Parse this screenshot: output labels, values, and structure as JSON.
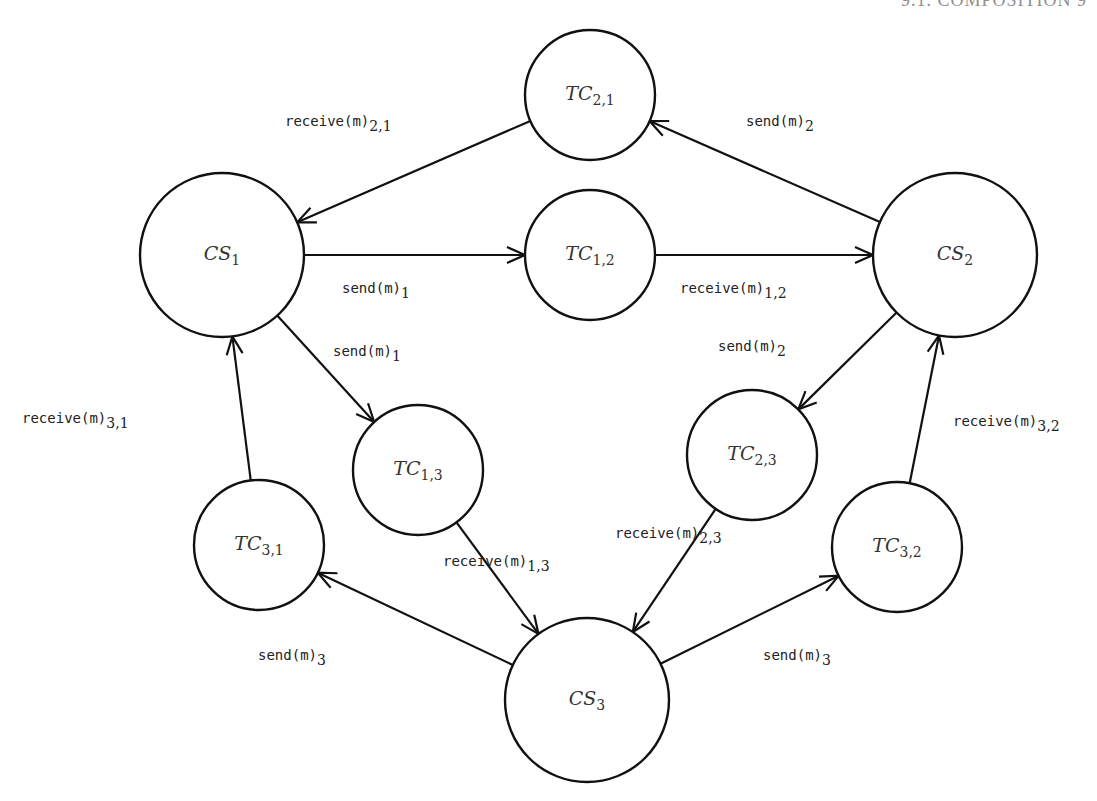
{
  "header": {
    "text": "9.1. COMPOSITION   9"
  },
  "diagram": {
    "nodes": [
      {
        "id": "TC21",
        "name": "TC",
        "sub": "2,1",
        "cx": 590,
        "cy": 95,
        "r": 65
      },
      {
        "id": "CS1",
        "name": "CS",
        "sub": "1",
        "cx": 222,
        "cy": 255,
        "r": 82
      },
      {
        "id": "TC12",
        "name": "TC",
        "sub": "1,2",
        "cx": 590,
        "cy": 255,
        "r": 65
      },
      {
        "id": "CS2",
        "name": "CS",
        "sub": "2",
        "cx": 955,
        "cy": 255,
        "r": 82
      },
      {
        "id": "TC13",
        "name": "TC",
        "sub": "1,3",
        "cx": 418,
        "cy": 470,
        "r": 65
      },
      {
        "id": "TC23",
        "name": "TC",
        "sub": "2,3",
        "cx": 752,
        "cy": 455,
        "r": 65
      },
      {
        "id": "TC31",
        "name": "TC",
        "sub": "3,1",
        "cx": 259,
        "cy": 545,
        "r": 65
      },
      {
        "id": "TC32",
        "name": "TC",
        "sub": "3,2",
        "cx": 897,
        "cy": 547,
        "r": 65
      },
      {
        "id": "CS3",
        "name": "CS",
        "sub": "3",
        "cx": 587,
        "cy": 700,
        "r": 82
      }
    ],
    "edges": [
      {
        "from": "TC21",
        "to": "CS1",
        "label": "receive(m)",
        "sub": "2,1",
        "lx": 285,
        "ly": 123
      },
      {
        "from": "CS2",
        "to": "TC21",
        "label": "send(m)",
        "sub": "2",
        "lx": 746,
        "ly": 123
      },
      {
        "from": "CS1",
        "to": "TC12",
        "label": "send(m)",
        "sub": "1",
        "lx": 342,
        "ly": 290
      },
      {
        "from": "TC12",
        "to": "CS2",
        "label": "receive(m)",
        "sub": "1,2",
        "lx": 680,
        "ly": 290
      },
      {
        "from": "CS1",
        "to": "TC13",
        "label": "send(m)",
        "sub": "1",
        "lx": 333,
        "ly": 353
      },
      {
        "from": "TC31",
        "to": "CS1",
        "label": "receive(m)",
        "sub": "3,1",
        "lx": 22,
        "ly": 420
      },
      {
        "from": "CS2",
        "to": "TC23",
        "label": "send(m)",
        "sub": "2",
        "lx": 718,
        "ly": 348
      },
      {
        "from": "TC32",
        "to": "CS2",
        "label": "receive(m)",
        "sub": "3,2",
        "lx": 953,
        "ly": 423
      },
      {
        "from": "TC13",
        "to": "CS3",
        "label": "receive(m)",
        "sub": "1,3",
        "lx": 443,
        "ly": 563
      },
      {
        "from": "TC23",
        "to": "CS3",
        "label": "receive(m)",
        "sub": "2,3",
        "lx": 615,
        "ly": 535
      },
      {
        "from": "CS3",
        "to": "TC31",
        "label": "send(m)",
        "sub": "3",
        "lx": 258,
        "ly": 657
      },
      {
        "from": "CS3",
        "to": "TC32",
        "label": "send(m)",
        "sub": "3",
        "lx": 763,
        "ly": 657
      }
    ]
  },
  "colors": {
    "stroke": "#111111",
    "background": "#ffffff",
    "text": "#222222"
  }
}
